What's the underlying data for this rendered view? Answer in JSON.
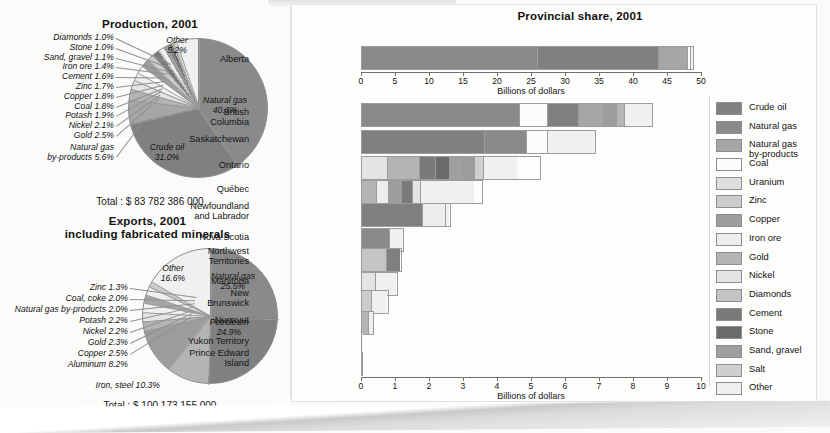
{
  "colors": {
    "crude_oil": "#808080",
    "natural_gas": "#8a8a8a",
    "natural_gas_byproducts": "#a6a6a6",
    "coal": "#fcfcfc",
    "uranium": "#dedede",
    "zinc": "#cccccc",
    "copper": "#9d9d9d",
    "iron_ore": "#ededed",
    "gold": "#b4b4b4",
    "nickel": "#e4e4e4",
    "diamonds": "#c4c4c4",
    "cement": "#7a7a7a",
    "stone": "#6a6a6a",
    "sand_gravel": "#a0a0a0",
    "salt": "#cfcfcf",
    "other": "#f0f0f0",
    "outline": "#9c9c9c"
  },
  "production": {
    "title": "Production, 2001",
    "total_label": "Total : $ 83 782 386 000",
    "inside_labels": [
      {
        "name": "Natural gas",
        "pct": "40.3%"
      },
      {
        "name": "Crude oil",
        "pct": "31.0%"
      },
      {
        "name": "Other",
        "pct": "5.2%"
      }
    ],
    "callout_labels": [
      "Diamonds 1.0%",
      "Stone 1.0%",
      "Sand, gravel 1.1%",
      "Iron ore 1.4%",
      "Cement 1.6%",
      "Zinc 1.7%",
      "Copper 1.8%",
      "Coal 1.8%",
      "Potash 1.9%",
      "Nickel 2.1%",
      "Gold 2.5%"
    ],
    "byproducts_label": "Natural gas\nby-products 5.6%"
  },
  "exports": {
    "title_line1": "Exports, 2001",
    "title_line2": "including fabricated minerals",
    "total_label": "Total : $ 100 173 155 000",
    "inside_labels": [
      {
        "name": "Natural gas",
        "pct": "25.5%"
      },
      {
        "name": "Petroleum",
        "pct": "24.9%"
      },
      {
        "name": "Other",
        "pct": "16.6%"
      }
    ],
    "callout_labels": [
      "Zinc 1.3%",
      "Coal, coke 2.0%",
      "Natural gas by-products 2.0%",
      "Potash 2.2%",
      "Nickel 2.2%",
      "Gold 2.3%",
      "Copper 2.5%"
    ],
    "aluminum_label": "Aluminum 8.2%",
    "iron_steel_label": "Iron, steel 10.3%"
  },
  "provincial": {
    "title": "Provincial share, 2001",
    "axis_title_top": "Billions of dollars",
    "axis_title_bottom": "Billions of dollars",
    "top_axis": {
      "min": 0,
      "max": 50,
      "ticks": [
        "0",
        "5",
        "10",
        "15",
        "20",
        "25",
        "30",
        "35",
        "40",
        "45",
        "50"
      ]
    },
    "bottom_axis": {
      "min": 0,
      "max": 10,
      "ticks": [
        "0",
        "1",
        "2",
        "3",
        "4",
        "5",
        "6",
        "7",
        "8",
        "9",
        "10"
      ]
    },
    "alberta": {
      "label": "Alberta",
      "total": 48.9,
      "segments": [
        {
          "commodity": "Natural gas",
          "value": 26.1
        },
        {
          "commodity": "Crude oil",
          "value": 17.9
        },
        {
          "commodity": "Natural gas by-products",
          "value": 4.3
        },
        {
          "commodity": "Coal",
          "value": 0.35
        },
        {
          "commodity": "Other",
          "value": 0.25
        }
      ]
    },
    "rows": [
      {
        "label": "British\nColumbia",
        "total": 8.6,
        "segments": [
          {
            "commodity": "Natural gas",
            "value": 4.68
          },
          {
            "commodity": "Coal",
            "value": 0.82
          },
          {
            "commodity": "Crude oil",
            "value": 0.92
          },
          {
            "commodity": "Natural gas by-products",
            "value": 0.74
          },
          {
            "commodity": "Copper",
            "value": 0.38
          },
          {
            "commodity": "Gold",
            "value": 0.26
          },
          {
            "commodity": "Other",
            "value": 0.8
          }
        ]
      },
      {
        "label": "Saskatchewan",
        "total": 6.9,
        "segments": [
          {
            "commodity": "Crude oil",
            "value": 3.65
          },
          {
            "commodity": "Natural gas",
            "value": 1.25
          },
          {
            "commodity": "Coal",
            "value": 0.62
          },
          {
            "commodity": "Other",
            "value": 1.38
          }
        ]
      },
      {
        "label": "Ontario",
        "total": 5.3,
        "segments": [
          {
            "commodity": "Nickel",
            "value": 0.78
          },
          {
            "commodity": "Gold",
            "value": 0.95
          },
          {
            "commodity": "Cement",
            "value": 0.47
          },
          {
            "commodity": "Stone",
            "value": 0.42
          },
          {
            "commodity": "Sand, gravel",
            "value": 0.38
          },
          {
            "commodity": "Copper",
            "value": 0.36
          },
          {
            "commodity": "Salt",
            "value": 0.28
          },
          {
            "commodity": "Other",
            "value": 0.96
          }
        ]
      },
      {
        "label": "Québec",
        "total": 3.6,
        "segments": [
          {
            "commodity": "Gold",
            "value": 0.45
          },
          {
            "commodity": "Iron ore",
            "value": 0.36
          },
          {
            "commodity": "Copper",
            "value": 0.39
          },
          {
            "commodity": "Cement",
            "value": 0.33
          },
          {
            "commodity": "Nickel",
            "value": 0.23
          },
          {
            "commodity": "Other",
            "value": 1.6
          }
        ]
      },
      {
        "label": "Newfoundland\nand Labrador",
        "total": 2.65,
        "segments": [
          {
            "commodity": "Crude oil",
            "value": 1.82
          },
          {
            "commodity": "Iron ore",
            "value": 0.72
          },
          {
            "commodity": "Other",
            "value": 0.08
          }
        ]
      },
      {
        "label": "Nova Scotia",
        "total": 1.27,
        "segments": [
          {
            "commodity": "Natural gas",
            "value": 0.87
          },
          {
            "commodity": "Other",
            "value": 0.38
          }
        ]
      },
      {
        "label": "Northwest\nTerritories",
        "total": 1.22,
        "segments": [
          {
            "commodity": "Diamonds",
            "value": 0.77
          },
          {
            "commodity": "Crude oil",
            "value": 0.42
          }
        ]
      },
      {
        "label": "Manitoba",
        "total": 1.08,
        "segments": [
          {
            "commodity": "Nickel",
            "value": 0.42
          },
          {
            "commodity": "Other",
            "value": 0.64
          }
        ]
      },
      {
        "label": "New\nBrunswick",
        "total": 0.82,
        "segments": [
          {
            "commodity": "Zinc",
            "value": 0.33
          },
          {
            "commodity": "Other",
            "value": 0.47
          }
        ]
      },
      {
        "label": "Nunavut",
        "total": 0.38,
        "segments": [
          {
            "commodity": "Gold",
            "value": 0.26
          },
          {
            "commodity": "Other",
            "value": 0.11
          }
        ]
      },
      {
        "label": "Yukon Territory",
        "total": 0.07,
        "segments": [
          {
            "commodity": "Other",
            "value": 0.07
          }
        ]
      },
      {
        "label": "Prince Edward\nIsland",
        "total": 0.012,
        "segments": [
          {
            "commodity": "Other",
            "value": 0.012
          }
        ]
      }
    ]
  },
  "legend": {
    "items": [
      {
        "label": "Crude oil",
        "key": "crude_oil"
      },
      {
        "label": "Natural gas",
        "key": "natural_gas"
      },
      {
        "label": "Natural gas\nby-products",
        "key": "natural_gas_byproducts"
      },
      {
        "label": "Coal",
        "key": "coal"
      },
      {
        "label": "Uranium",
        "key": "uranium"
      },
      {
        "label": "Zinc",
        "key": "zinc"
      },
      {
        "label": "Copper",
        "key": "copper"
      },
      {
        "label": "Iron ore",
        "key": "iron_ore"
      },
      {
        "label": "Gold",
        "key": "gold"
      },
      {
        "label": "Nickel",
        "key": "nickel"
      },
      {
        "label": "Diamonds",
        "key": "diamonds"
      },
      {
        "label": "Cement",
        "key": "cement"
      },
      {
        "label": "Stone",
        "key": "stone"
      },
      {
        "label": "Sand, gravel",
        "key": "sand_gravel"
      },
      {
        "label": "Salt",
        "key": "salt"
      },
      {
        "label": "Other",
        "key": "other"
      }
    ]
  },
  "chart_data": [
    {
      "type": "pie",
      "title": "Production, 2001",
      "total": "$ 83 782 386 000",
      "labels": [
        "Natural gas",
        "Crude oil",
        "Other",
        "Natural gas by-products",
        "Gold",
        "Nickel",
        "Potash",
        "Coal",
        "Copper",
        "Zinc",
        "Cement",
        "Iron ore",
        "Sand, gravel",
        "Stone",
        "Diamonds"
      ],
      "values": [
        40.3,
        31.0,
        5.2,
        5.6,
        2.5,
        2.1,
        1.9,
        1.8,
        1.8,
        1.7,
        1.6,
        1.4,
        1.1,
        1.0,
        1.0
      ],
      "unit": "percent"
    },
    {
      "type": "pie",
      "title": "Exports, 2001 including fabricated minerals",
      "total": "$ 100 173 155 000",
      "labels": [
        "Natural gas",
        "Petroleum",
        "Other",
        "Iron, steel",
        "Aluminum",
        "Copper",
        "Gold",
        "Nickel",
        "Potash",
        "Natural gas by-products",
        "Coal, coke",
        "Zinc"
      ],
      "values": [
        25.5,
        24.9,
        16.6,
        10.3,
        8.2,
        2.5,
        2.3,
        2.2,
        2.2,
        2.0,
        2.0,
        1.3
      ],
      "unit": "percent"
    },
    {
      "type": "bar",
      "title": "Provincial share, 2001",
      "orientation": "horizontal",
      "stacked": true,
      "xlabel": "Billions of dollars",
      "ylabel": "",
      "grid": false,
      "legend_position": "right",
      "axes": [
        {
          "for": "Alberta",
          "xlim": [
            0,
            50
          ],
          "xticks": [
            0,
            5,
            10,
            15,
            20,
            25,
            30,
            35,
            40,
            45,
            50
          ]
        },
        {
          "for": "other provinces",
          "xlim": [
            0,
            10
          ],
          "xticks": [
            0,
            1,
            2,
            3,
            4,
            5,
            6,
            7,
            8,
            9,
            10
          ]
        }
      ],
      "categories": [
        "Alberta",
        "British Columbia",
        "Saskatchewan",
        "Ontario",
        "Québec",
        "Newfoundland and Labrador",
        "Nova Scotia",
        "Northwest Territories",
        "Manitoba",
        "New Brunswick",
        "Nunavut",
        "Yukon Territory",
        "Prince Edward Island"
      ],
      "totals": [
        48.9,
        8.6,
        6.9,
        5.3,
        3.6,
        2.65,
        1.27,
        1.22,
        1.08,
        0.82,
        0.38,
        0.07,
        0.012
      ],
      "series": [
        {
          "name": "Crude oil",
          "values": [
            17.9,
            0.92,
            3.65,
            0,
            0,
            1.82,
            0,
            0.42,
            0,
            0,
            0,
            0,
            0
          ]
        },
        {
          "name": "Natural gas",
          "values": [
            26.1,
            4.68,
            1.25,
            0,
            0,
            0,
            0.87,
            0,
            0,
            0,
            0,
            0,
            0
          ]
        },
        {
          "name": "Natural gas by-products",
          "values": [
            4.3,
            0.74,
            0,
            0,
            0,
            0,
            0,
            0,
            0,
            0,
            0,
            0,
            0
          ]
        },
        {
          "name": "Coal",
          "values": [
            0.35,
            0.82,
            0.62,
            0,
            0,
            0,
            0,
            0,
            0,
            0,
            0,
            0,
            0
          ]
        },
        {
          "name": "Zinc",
          "values": [
            0,
            0,
            0,
            0,
            0,
            0,
            0,
            0,
            0,
            0.33,
            0,
            0,
            0
          ]
        },
        {
          "name": "Copper",
          "values": [
            0,
            0.38,
            0,
            0.36,
            0.39,
            0,
            0,
            0,
            0,
            0,
            0,
            0,
            0
          ]
        },
        {
          "name": "Iron ore",
          "values": [
            0,
            0,
            0,
            0,
            0.36,
            0.72,
            0,
            0,
            0,
            0,
            0,
            0,
            0
          ]
        },
        {
          "name": "Gold",
          "values": [
            0,
            0.26,
            0,
            0.95,
            0.45,
            0,
            0,
            0,
            0,
            0,
            0.26,
            0,
            0
          ]
        },
        {
          "name": "Nickel",
          "values": [
            0,
            0,
            0,
            0.78,
            0.23,
            0,
            0,
            0,
            0.42,
            0,
            0,
            0,
            0
          ]
        },
        {
          "name": "Diamonds",
          "values": [
            0,
            0,
            0,
            0,
            0,
            0,
            0,
            0.77,
            0,
            0,
            0,
            0,
            0
          ]
        },
        {
          "name": "Cement",
          "values": [
            0,
            0,
            0,
            0.47,
            0.33,
            0,
            0,
            0,
            0,
            0,
            0,
            0,
            0
          ]
        },
        {
          "name": "Stone",
          "values": [
            0,
            0,
            0,
            0.42,
            0,
            0,
            0,
            0,
            0,
            0,
            0,
            0,
            0
          ]
        },
        {
          "name": "Sand, gravel",
          "values": [
            0,
            0,
            0,
            0.38,
            0,
            0,
            0,
            0,
            0,
            0,
            0,
            0,
            0
          ]
        },
        {
          "name": "Salt",
          "values": [
            0,
            0,
            0,
            0.28,
            0,
            0,
            0,
            0,
            0,
            0,
            0,
            0,
            0
          ]
        },
        {
          "name": "Other",
          "values": [
            0.25,
            0.8,
            1.38,
            0.96,
            1.6,
            0.08,
            0.38,
            0,
            0.64,
            0.47,
            0.11,
            0.07,
            0.012
          ]
        }
      ]
    }
  ]
}
